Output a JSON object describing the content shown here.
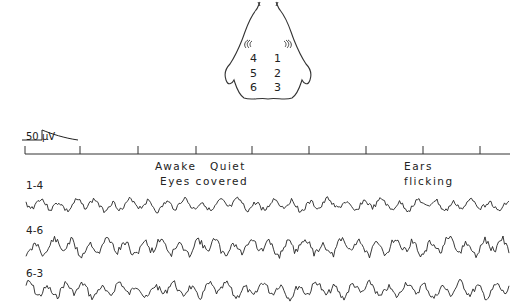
{
  "figure": {
    "head_diagram": {
      "electrodes": [
        {
          "label": "4",
          "x": 250,
          "y": 52
        },
        {
          "label": "1",
          "x": 274,
          "y": 52
        },
        {
          "label": "5",
          "x": 250,
          "y": 67
        },
        {
          "label": "2",
          "x": 274,
          "y": 67
        },
        {
          "label": "6",
          "x": 250,
          "y": 81
        },
        {
          "label": "3",
          "x": 274,
          "y": 81
        }
      ]
    },
    "calibration": {
      "label": "50 µV"
    },
    "time_axis": {
      "y": 154,
      "x_start": 25,
      "x_end": 510,
      "ticks": [
        25,
        80,
        138,
        196,
        252,
        309,
        366,
        423,
        480
      ]
    },
    "annotations": [
      {
        "text": "Awake",
        "x": 155,
        "y": 160
      },
      {
        "text": "Quiet",
        "x": 210,
        "y": 160
      },
      {
        "text": "Eyes covered",
        "x": 160,
        "y": 175
      },
      {
        "text": "Ears",
        "x": 404,
        "y": 160
      },
      {
        "text": "flicking",
        "x": 404,
        "y": 175
      }
    ],
    "traces": [
      {
        "label": "1-4",
        "label_y": 179,
        "baseline_y": 205,
        "amplitude": 7,
        "seed": 3
      },
      {
        "label": "4-6",
        "label_y": 224,
        "baseline_y": 247,
        "amplitude": 10,
        "seed": 11
      },
      {
        "label": "6-3",
        "label_y": 267,
        "baseline_y": 290,
        "amplitude": 9,
        "seed": 7
      }
    ]
  }
}
